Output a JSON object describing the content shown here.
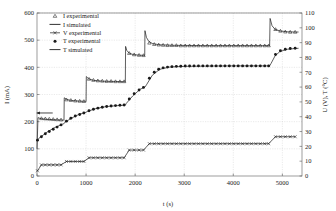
{
  "chart_data": {
    "type": "line",
    "title": "",
    "xlabel": "t (s)",
    "ylabel": "I (mA)",
    "y2label": "U (V), T (°C)",
    "xlim": [
      0,
      5400
    ],
    "ylim": [
      0,
      600
    ],
    "y2lim": [
      0,
      110
    ],
    "xticks": [
      0,
      1000,
      2000,
      3000,
      4000,
      5000
    ],
    "yticks": [
      0,
      100,
      200,
      300,
      400,
      500,
      600
    ],
    "y2ticks": [
      0,
      10,
      20,
      30,
      40,
      50,
      60,
      70,
      80,
      90,
      100,
      110
    ],
    "grid": true,
    "legend_position": "top-left",
    "legend": [
      {
        "label": "I experimental",
        "marker": "triangle-open",
        "line": "none"
      },
      {
        "label": "I simulated",
        "marker": "none",
        "line": "solid"
      },
      {
        "label": "V experimental",
        "marker": "x-cross",
        "line": "solid"
      },
      {
        "label": "T experimental",
        "marker": "circle-filled",
        "line": "none"
      },
      {
        "label": "T simulated",
        "marker": "none",
        "line": "solid"
      }
    ],
    "annotations": [
      {
        "name": "left-arrow-current",
        "text": "",
        "x": 320,
        "y": 232,
        "direction": "left"
      },
      {
        "name": "right-arrow-temperature",
        "text": "",
        "x": 4950,
        "y": 413,
        "direction": "right"
      },
      {
        "name": "right-arrow-voltage",
        "text": "",
        "x": 4950,
        "y": 122,
        "direction": "right"
      }
    ],
    "series": [
      {
        "name": "I simulated",
        "axis": "left",
        "style": "solid-line",
        "points": [
          [
            0,
            100
          ],
          [
            20,
            215
          ],
          [
            60,
            212
          ],
          [
            120,
            210
          ],
          [
            250,
            208
          ],
          [
            400,
            207
          ],
          [
            520,
            206
          ],
          [
            545,
            206
          ],
          [
            550,
            205
          ],
          [
            555,
            288
          ],
          [
            600,
            282
          ],
          [
            700,
            278
          ],
          [
            850,
            276
          ],
          [
            960,
            275
          ],
          [
            995,
            275
          ],
          [
            1000,
            274
          ],
          [
            1005,
            366
          ],
          [
            1050,
            358
          ],
          [
            1150,
            352
          ],
          [
            1350,
            349
          ],
          [
            1600,
            348
          ],
          [
            1790,
            347
          ],
          [
            1800,
            347
          ],
          [
            1805,
            477
          ],
          [
            1830,
            462
          ],
          [
            1880,
            452
          ],
          [
            1960,
            447
          ],
          [
            2080,
            445
          ],
          [
            2180,
            444
          ],
          [
            2195,
            444
          ],
          [
            2200,
            535
          ],
          [
            2230,
            510
          ],
          [
            2280,
            495
          ],
          [
            2360,
            487
          ],
          [
            2500,
            483
          ],
          [
            2800,
            481
          ],
          [
            3400,
            480
          ],
          [
            4000,
            480
          ],
          [
            4600,
            480
          ],
          [
            4740,
            480
          ],
          [
            4750,
            580
          ],
          [
            4790,
            553
          ],
          [
            4850,
            540
          ],
          [
            4950,
            534
          ],
          [
            5100,
            531
          ],
          [
            5250,
            530
          ],
          [
            5330,
            530
          ]
        ]
      },
      {
        "name": "I experimental",
        "axis": "left",
        "style": "triangle-open-markers",
        "points": [
          [
            90,
            212
          ],
          [
            170,
            211
          ],
          [
            250,
            210
          ],
          [
            330,
            209
          ],
          [
            410,
            208
          ],
          [
            490,
            207
          ],
          [
            600,
            281
          ],
          [
            690,
            279
          ],
          [
            780,
            277
          ],
          [
            870,
            276
          ],
          [
            955,
            275
          ],
          [
            1060,
            357
          ],
          [
            1150,
            353
          ],
          [
            1240,
            351
          ],
          [
            1330,
            350
          ],
          [
            1420,
            349
          ],
          [
            1510,
            349
          ],
          [
            1600,
            348
          ],
          [
            1690,
            348
          ],
          [
            1775,
            348
          ],
          [
            1880,
            452
          ],
          [
            1980,
            447
          ],
          [
            2080,
            445
          ],
          [
            2170,
            444
          ],
          [
            2290,
            490
          ],
          [
            2390,
            485
          ],
          [
            2480,
            483
          ],
          [
            2570,
            482
          ],
          [
            2660,
            481
          ],
          [
            2750,
            481
          ],
          [
            2840,
            481
          ],
          [
            2930,
            480
          ],
          [
            3020,
            480
          ],
          [
            3110,
            480
          ],
          [
            3200,
            480
          ],
          [
            3290,
            480
          ],
          [
            3380,
            480
          ],
          [
            3470,
            480
          ],
          [
            3560,
            480
          ],
          [
            3650,
            480
          ],
          [
            3740,
            480
          ],
          [
            3830,
            480
          ],
          [
            3920,
            480
          ],
          [
            4010,
            480
          ],
          [
            4100,
            480
          ],
          [
            4190,
            480
          ],
          [
            4280,
            480
          ],
          [
            4370,
            480
          ],
          [
            4460,
            480
          ],
          [
            4550,
            480
          ],
          [
            4640,
            480
          ],
          [
            4720,
            480
          ],
          [
            4860,
            540
          ],
          [
            4960,
            534
          ],
          [
            5060,
            531
          ],
          [
            5160,
            530
          ],
          [
            5260,
            530
          ]
        ]
      },
      {
        "name": "T simulated",
        "axis": "right",
        "style": "solid-line",
        "points": [
          [
            0,
            24
          ],
          [
            40,
            25.5
          ],
          [
            100,
            27
          ],
          [
            200,
            29.5
          ],
          [
            350,
            32.5
          ],
          [
            520,
            35
          ],
          [
            545,
            35.2
          ],
          [
            560,
            36
          ],
          [
            700,
            39
          ],
          [
            850,
            41.5
          ],
          [
            1000,
            43
          ],
          [
            1020,
            43.5
          ],
          [
            1200,
            45.5
          ],
          [
            1400,
            46.8
          ],
          [
            1600,
            47.4
          ],
          [
            1800,
            47.8
          ],
          [
            1820,
            49
          ],
          [
            1950,
            54
          ],
          [
            2100,
            58.5
          ],
          [
            2200,
            60
          ],
          [
            2230,
            61.5
          ],
          [
            2350,
            68
          ],
          [
            2500,
            72
          ],
          [
            2700,
            73.5
          ],
          [
            3000,
            74
          ],
          [
            3500,
            74.2
          ],
          [
            4000,
            74.3
          ],
          [
            4500,
            74.3
          ],
          [
            4740,
            74.3
          ],
          [
            4770,
            76
          ],
          [
            4850,
            81
          ],
          [
            4950,
            84
          ],
          [
            5100,
            85.5
          ],
          [
            5250,
            86
          ],
          [
            5330,
            86.2
          ]
        ]
      },
      {
        "name": "T experimental",
        "axis": "right",
        "style": "circle-filled-markers",
        "points": [
          [
            10,
            24.2
          ],
          [
            90,
            26.5
          ],
          [
            170,
            28.5
          ],
          [
            250,
            30
          ],
          [
            330,
            31.5
          ],
          [
            410,
            33
          ],
          [
            490,
            34.5
          ],
          [
            600,
            37
          ],
          [
            690,
            39
          ],
          [
            780,
            40.5
          ],
          [
            870,
            41.5
          ],
          [
            955,
            42.5
          ],
          [
            1060,
            44
          ],
          [
            1150,
            45
          ],
          [
            1240,
            45.8
          ],
          [
            1330,
            46.4
          ],
          [
            1420,
            46.9
          ],
          [
            1510,
            47.2
          ],
          [
            1600,
            47.5
          ],
          [
            1690,
            47.7
          ],
          [
            1775,
            47.9
          ],
          [
            1880,
            52
          ],
          [
            1980,
            55.5
          ],
          [
            2080,
            58
          ],
          [
            2170,
            59.8
          ],
          [
            2290,
            66
          ],
          [
            2390,
            70
          ],
          [
            2480,
            72
          ],
          [
            2570,
            73
          ],
          [
            2660,
            73.5
          ],
          [
            2750,
            73.8
          ],
          [
            2840,
            74
          ],
          [
            2930,
            74.1
          ],
          [
            3020,
            74.2
          ],
          [
            3110,
            74.2
          ],
          [
            3200,
            74.3
          ],
          [
            3290,
            74.3
          ],
          [
            3380,
            74.3
          ],
          [
            3470,
            74.3
          ],
          [
            3560,
            74.3
          ],
          [
            3650,
            74.3
          ],
          [
            3740,
            74.3
          ],
          [
            3830,
            74.3
          ],
          [
            3920,
            74.3
          ],
          [
            4010,
            74.3
          ],
          [
            4100,
            74.3
          ],
          [
            4190,
            74.3
          ],
          [
            4280,
            74.3
          ],
          [
            4370,
            74.3
          ],
          [
            4460,
            74.3
          ],
          [
            4550,
            74.3
          ],
          [
            4640,
            74.3
          ],
          [
            4720,
            74.3
          ],
          [
            4860,
            82
          ],
          [
            4960,
            84.5
          ],
          [
            5060,
            85.5
          ],
          [
            5160,
            86
          ],
          [
            5260,
            86.2
          ]
        ]
      },
      {
        "name": "V experimental",
        "axis": "right",
        "style": "x-cross-markers-line",
        "points": [
          [
            10,
            3.5
          ],
          [
            90,
            7.5
          ],
          [
            170,
            7.5
          ],
          [
            250,
            7.5
          ],
          [
            330,
            7.5
          ],
          [
            410,
            7.5
          ],
          [
            490,
            7.5
          ],
          [
            600,
            9.8
          ],
          [
            690,
            9.8
          ],
          [
            780,
            9.8
          ],
          [
            870,
            9.8
          ],
          [
            955,
            9.8
          ],
          [
            1060,
            12.3
          ],
          [
            1150,
            12.3
          ],
          [
            1240,
            12.3
          ],
          [
            1330,
            12.3
          ],
          [
            1420,
            12.3
          ],
          [
            1510,
            12.3
          ],
          [
            1600,
            12.3
          ],
          [
            1690,
            12.3
          ],
          [
            1775,
            12.3
          ],
          [
            1880,
            17.5
          ],
          [
            1980,
            17.5
          ],
          [
            2080,
            17.5
          ],
          [
            2170,
            17.5
          ],
          [
            2290,
            21.8
          ],
          [
            2390,
            21.8
          ],
          [
            2480,
            21.8
          ],
          [
            2570,
            21.8
          ],
          [
            2660,
            21.8
          ],
          [
            2750,
            21.8
          ],
          [
            2840,
            21.8
          ],
          [
            2930,
            21.8
          ],
          [
            3020,
            21.8
          ],
          [
            3110,
            21.8
          ],
          [
            3200,
            21.8
          ],
          [
            3290,
            21.8
          ],
          [
            3380,
            21.8
          ],
          [
            3470,
            21.8
          ],
          [
            3560,
            21.8
          ],
          [
            3650,
            21.8
          ],
          [
            3740,
            21.8
          ],
          [
            3830,
            21.8
          ],
          [
            3920,
            21.8
          ],
          [
            4010,
            21.8
          ],
          [
            4100,
            21.8
          ],
          [
            4190,
            21.8
          ],
          [
            4280,
            21.8
          ],
          [
            4370,
            21.8
          ],
          [
            4460,
            21.8
          ],
          [
            4550,
            21.8
          ],
          [
            4640,
            21.8
          ],
          [
            4720,
            21.8
          ],
          [
            4860,
            26.5
          ],
          [
            4960,
            26.5
          ],
          [
            5060,
            26.5
          ],
          [
            5160,
            26.5
          ],
          [
            5260,
            26.5
          ]
        ]
      }
    ]
  },
  "axes": {
    "x_label": "t (s)",
    "y_left_label": "I (mA)",
    "y_right_label": "U (V), T (°C)",
    "x_ticks": [
      "0",
      "1000",
      "2000",
      "3000",
      "4000",
      "5000"
    ],
    "y_left_ticks": [
      "600",
      "500",
      "400",
      "300",
      "200",
      "100",
      "0"
    ],
    "y_right_ticks": [
      "110",
      "100",
      "90",
      "80",
      "70",
      "60",
      "50",
      "40",
      "30",
      "20",
      "10",
      "0"
    ]
  },
  "legend": {
    "items": [
      "I experimental",
      "I simulated",
      "V experimental",
      "T experimental",
      "T simulated"
    ]
  },
  "colors": {
    "line": "#1a1a1a",
    "grid": "#c9c9c9",
    "axis": "#5a5a5a",
    "background": "#ffffff"
  }
}
